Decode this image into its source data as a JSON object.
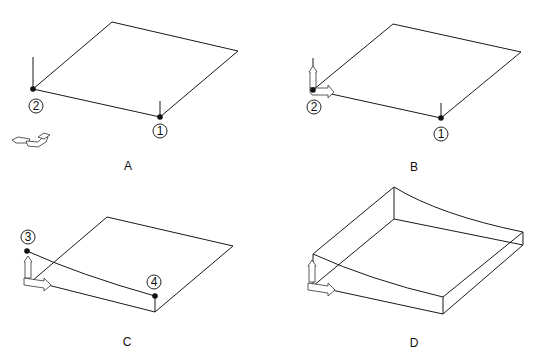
{
  "figure": {
    "panels": [
      {
        "id": "A",
        "caption": "A",
        "points": [
          {
            "label": "1"
          },
          {
            "label": "2"
          }
        ]
      },
      {
        "id": "B",
        "caption": "B",
        "points": [
          {
            "label": "1"
          },
          {
            "label": "2"
          }
        ]
      },
      {
        "id": "C",
        "caption": "C",
        "points": [
          {
            "label": "3"
          },
          {
            "label": "4"
          }
        ]
      },
      {
        "id": "D",
        "caption": "D",
        "points": []
      }
    ]
  }
}
